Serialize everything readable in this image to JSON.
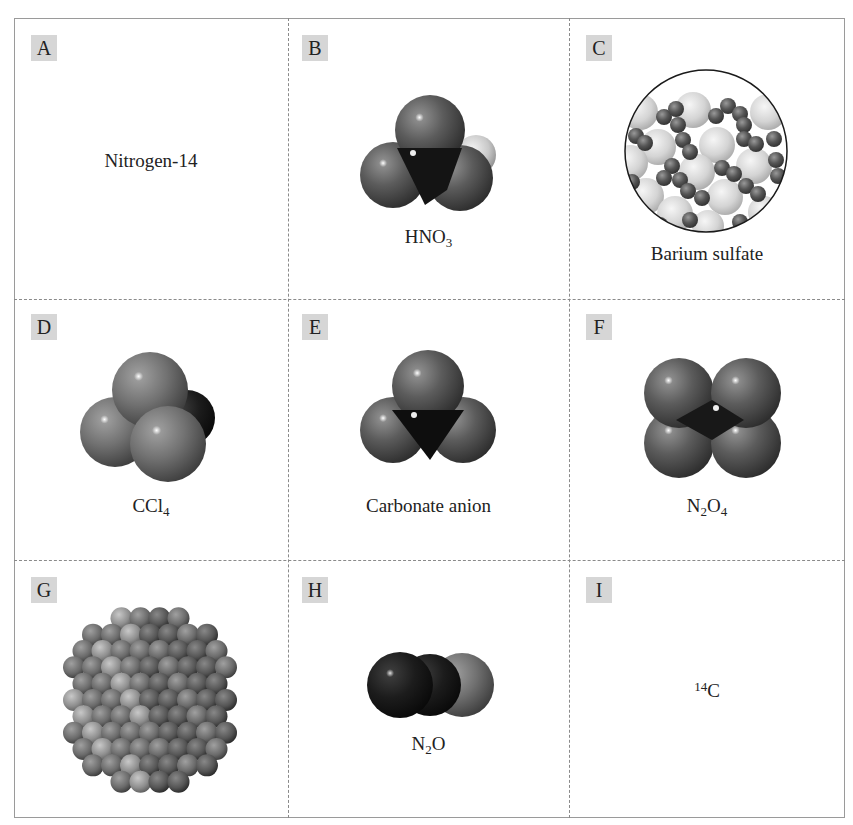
{
  "figure": {
    "cells": [
      {
        "letter": "A",
        "caption_main": "Nitrogen-14",
        "caption_sub": "",
        "caption_tail": "",
        "visual": "text-only"
      },
      {
        "letter": "B",
        "caption_main": "HNO",
        "caption_sub": "3",
        "caption_tail": "",
        "visual": "space-filling molecule"
      },
      {
        "letter": "C",
        "caption_main": "Barium sulfate",
        "caption_sub": "",
        "caption_tail": "",
        "visual": "ionic lattice in circle"
      },
      {
        "letter": "D",
        "caption_main": "CCl",
        "caption_sub": "4",
        "caption_tail": "",
        "visual": "space-filling molecule"
      },
      {
        "letter": "E",
        "caption_main": "Carbonate anion",
        "caption_sub": "",
        "caption_tail": "",
        "visual": "space-filling molecule"
      },
      {
        "letter": "F",
        "caption_main": "N",
        "caption_sub": "2",
        "caption_tail": "O",
        "caption_sub2": "4",
        "visual": "space-filling molecule"
      },
      {
        "letter": "G",
        "caption_main": "",
        "caption_sub": "",
        "caption_tail": "",
        "visual": "metal crystal cluster"
      },
      {
        "letter": "H",
        "caption_main": "N",
        "caption_sub": "2",
        "caption_tail": "O",
        "visual": "space-filling molecule"
      },
      {
        "letter": "I",
        "caption_sup": "14",
        "caption_main": "C",
        "visual": "text-only"
      }
    ],
    "colors": {
      "badge_bg": "#d6d6d6",
      "border": "#9a9a9a",
      "oxygen": "#5a5a5a",
      "nitrogen": "#1e1e1e",
      "hydrogen": "#d0d0d0",
      "chlorine": "#6e6e6e",
      "barium": "#d8d8d8"
    }
  }
}
